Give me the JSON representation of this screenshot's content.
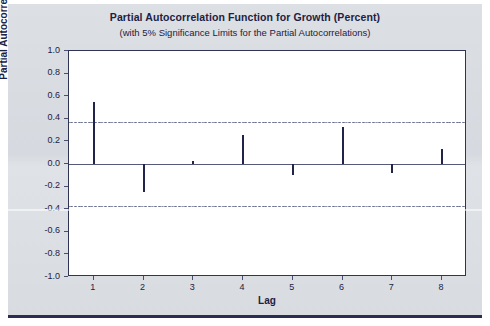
{
  "chart_data": {
    "type": "bar",
    "title": "Partial Autocorrelation Function for Growth (Percent)",
    "subtitle": "(with 5% Significance Limits for the Partial Autocorrelations)",
    "xlabel": "Lag",
    "ylabel": "Partial Autocorrelation",
    "categories": [
      1,
      2,
      3,
      4,
      5,
      6,
      7,
      8
    ],
    "values": [
      0.55,
      -0.25,
      0.03,
      0.26,
      -0.1,
      0.33,
      -0.08,
      0.13
    ],
    "series": [
      {
        "name": "Partial Autocorrelation",
        "values": [
          0.55,
          -0.25,
          0.03,
          0.26,
          -0.1,
          0.33,
          -0.08,
          0.13
        ]
      }
    ],
    "xtick_labels": [
      "1",
      "2",
      "3",
      "4",
      "5",
      "6",
      "7",
      "8"
    ],
    "ytick_labels": [
      "1.0",
      "0.8",
      "0.6",
      "0.4",
      "0.2",
      "0.0",
      "-0.2",
      "-0.4",
      "-0.6",
      "-0.8",
      "-1.0"
    ],
    "ytick_values": [
      1.0,
      0.8,
      0.6,
      0.4,
      0.2,
      0.0,
      -0.2,
      -0.4,
      -0.6,
      -0.8,
      -1.0
    ],
    "ylim": [
      -1.0,
      1.0
    ],
    "xlim": [
      0.5,
      8.5
    ],
    "significance_limits": {
      "upper": 0.37,
      "lower": -0.37,
      "level": "5%",
      "style": "dash-dot"
    },
    "grid": false,
    "legend": "none",
    "colors": {
      "bar": "#20244a",
      "axis": "#2f3354",
      "significance_line": "#6b708e",
      "plot_background": "#ffffff",
      "panel_background": "#d9dce1",
      "text": "#1d2142",
      "bottom_rule": "#2a2e52"
    }
  }
}
